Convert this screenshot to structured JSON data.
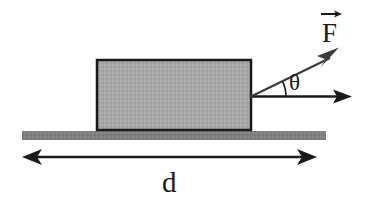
{
  "figure": {
    "type": "physics-free-body-diagram",
    "background_color": "#ffffff"
  },
  "block": {
    "name": "block",
    "label": "",
    "fill_color": "#a8a8a8",
    "stroke_color": "#1a1a1a",
    "x": 97,
    "y": 60,
    "width": 154,
    "height": 70,
    "stroke_width": 2.5
  },
  "ground": {
    "name": "ground-surface",
    "label": "",
    "fill_color": "#808080",
    "x": 22,
    "y": 131,
    "width": 304,
    "height": 9
  },
  "vectors": [
    {
      "id": "force-vector",
      "label": "F",
      "label_markup": "F",
      "has_vector_arrow_overbar": true,
      "label_x": 332,
      "label_y": 35,
      "origin_x": 250,
      "origin_y": 97,
      "tip_x": 338,
      "tip_y": 48,
      "angle_degrees": 26,
      "color": "#3a3a3a",
      "stroke_width": 2
    },
    {
      "id": "horizontal-reference-vector",
      "label": "",
      "label_markup": "",
      "has_vector_arrow_overbar": false,
      "origin_x": 250,
      "origin_y": 97,
      "tip_x": 352,
      "tip_y": 96,
      "angle_degrees": 0,
      "color": "#1a1a1a",
      "stroke_width": 2.5
    }
  ],
  "angle": {
    "id": "theta-angle",
    "label": "θ",
    "label_x": 296,
    "label_y": 90,
    "arc_radius": 36,
    "vertex_x": 250,
    "vertex_y": 97,
    "start_degrees": 0,
    "end_degrees": 26,
    "color": "#1a1a1a"
  },
  "dimension": {
    "id": "distance-dimension",
    "label": "d",
    "label_x": 170,
    "label_y": 190,
    "line_y": 157,
    "start_x": 22,
    "end_x": 317,
    "color": "#1a1a1a",
    "stroke_width": 2.5,
    "double_headed": true
  },
  "colors": {
    "block_fill": "#a8a8a8",
    "ground_fill": "#808080",
    "ink": "#1a1a1a",
    "force_arrow": "#3a3a3a",
    "background": "#ffffff"
  }
}
